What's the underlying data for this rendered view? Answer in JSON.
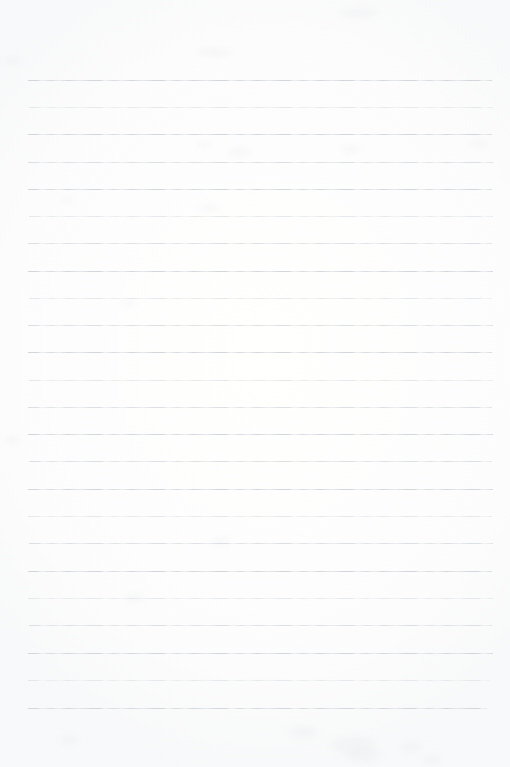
{
  "document": {
    "type": "lined-notebook-paper",
    "title": "Blank Ruled Notepad Sheet",
    "orientation": "portrait",
    "page_width_px": 510,
    "page_height_px": 767,
    "background_color": "#fffffe",
    "content_text": "",
    "has_handwriting": false,
    "has_header": false,
    "has_page_number": false
  },
  "ruling": {
    "line_count": 24,
    "first_line_y_px": 80,
    "line_spacing_px": 27.3,
    "line_thickness_px": 1,
    "line_left_x_px": 28,
    "line_right_x_px": 493,
    "line_color": "#dcdfe3",
    "line_color_faint": "#e6e9ec",
    "line_color_strong": "#d3d7dc",
    "top_margin_px": 80,
    "bottom_margin_px": 59,
    "left_margin_px": 28,
    "right_margin_px": 17,
    "lines": [
      {
        "index": 1,
        "y": 80,
        "x1": 28,
        "x2": 492,
        "weight": "strong"
      },
      {
        "index": 2,
        "y": 107,
        "x1": 29,
        "x2": 493,
        "weight": "faint"
      },
      {
        "index": 3,
        "y": 134,
        "x1": 28,
        "x2": 492,
        "weight": "strong"
      },
      {
        "index": 4,
        "y": 162,
        "x1": 28,
        "x2": 493,
        "weight": "normal"
      },
      {
        "index": 5,
        "y": 189,
        "x1": 28,
        "x2": 492,
        "weight": "strong"
      },
      {
        "index": 6,
        "y": 216,
        "x1": 29,
        "x2": 493,
        "weight": "faint"
      },
      {
        "index": 7,
        "y": 243,
        "x1": 28,
        "x2": 492,
        "weight": "normal"
      },
      {
        "index": 8,
        "y": 271,
        "x1": 28,
        "x2": 493,
        "weight": "strong"
      },
      {
        "index": 9,
        "y": 298,
        "x1": 29,
        "x2": 492,
        "weight": "faint"
      },
      {
        "index": 10,
        "y": 325,
        "x1": 28,
        "x2": 493,
        "weight": "normal"
      },
      {
        "index": 11,
        "y": 352,
        "x1": 28,
        "x2": 492,
        "weight": "strong"
      },
      {
        "index": 12,
        "y": 380,
        "x1": 29,
        "x2": 493,
        "weight": "faint"
      },
      {
        "index": 13,
        "y": 407,
        "x1": 28,
        "x2": 492,
        "weight": "normal"
      },
      {
        "index": 14,
        "y": 434,
        "x1": 28,
        "x2": 493,
        "weight": "strong"
      },
      {
        "index": 15,
        "y": 461,
        "x1": 29,
        "x2": 492,
        "weight": "normal"
      },
      {
        "index": 16,
        "y": 489,
        "x1": 28,
        "x2": 493,
        "weight": "strong"
      },
      {
        "index": 17,
        "y": 516,
        "x1": 28,
        "x2": 492,
        "weight": "faint"
      },
      {
        "index": 18,
        "y": 543,
        "x1": 29,
        "x2": 493,
        "weight": "normal"
      },
      {
        "index": 19,
        "y": 571,
        "x1": 28,
        "x2": 492,
        "weight": "strong"
      },
      {
        "index": 20,
        "y": 598,
        "x1": 28,
        "x2": 493,
        "weight": "faint"
      },
      {
        "index": 21,
        "y": 625,
        "x1": 29,
        "x2": 492,
        "weight": "normal"
      },
      {
        "index": 22,
        "y": 653,
        "x1": 28,
        "x2": 493,
        "weight": "strong"
      },
      {
        "index": 23,
        "y": 680,
        "x1": 28,
        "x2": 490,
        "weight": "faint"
      },
      {
        "index": 24,
        "y": 708,
        "x1": 28,
        "x2": 487,
        "weight": "strong"
      }
    ]
  },
  "artifacts": {
    "description": "faint scanner smudges on otherwise blank paper",
    "smudges": [
      {
        "x": 340,
        "y": 8,
        "w": 38,
        "h": 10
      },
      {
        "x": 196,
        "y": 48,
        "w": 26,
        "h": 8
      },
      {
        "x": 4,
        "y": 58,
        "w": 18,
        "h": 7
      },
      {
        "x": 213,
        "y": 50,
        "w": 20,
        "h": 6
      },
      {
        "x": 228,
        "y": 148,
        "w": 24,
        "h": 9
      },
      {
        "x": 340,
        "y": 146,
        "w": 20,
        "h": 7
      },
      {
        "x": 196,
        "y": 142,
        "w": 16,
        "h": 6
      },
      {
        "x": 60,
        "y": 198,
        "w": 14,
        "h": 5
      },
      {
        "x": 198,
        "y": 204,
        "w": 22,
        "h": 7
      },
      {
        "x": 470,
        "y": 140,
        "w": 16,
        "h": 8
      },
      {
        "x": 120,
        "y": 300,
        "w": 18,
        "h": 6
      },
      {
        "x": 6,
        "y": 436,
        "w": 14,
        "h": 9
      },
      {
        "x": 210,
        "y": 538,
        "w": 20,
        "h": 7
      },
      {
        "x": 124,
        "y": 594,
        "w": 22,
        "h": 8
      },
      {
        "x": 60,
        "y": 736,
        "w": 18,
        "h": 8
      },
      {
        "x": 288,
        "y": 726,
        "w": 30,
        "h": 12
      },
      {
        "x": 330,
        "y": 736,
        "w": 46,
        "h": 18
      },
      {
        "x": 346,
        "y": 748,
        "w": 34,
        "h": 14
      },
      {
        "x": 400,
        "y": 742,
        "w": 22,
        "h": 10
      },
      {
        "x": 424,
        "y": 756,
        "w": 16,
        "h": 8
      }
    ]
  }
}
